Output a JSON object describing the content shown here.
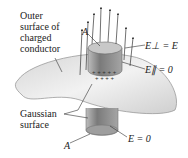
{
  "diagram": {
    "labels": {
      "outer_surface": [
        "Outer",
        "surface of",
        "charged",
        "conductor"
      ],
      "gaussian": [
        "Gaussian",
        "surface"
      ],
      "area_top": "A",
      "area_bottom": "A",
      "e_perp_outside": "E⊥ = E",
      "e_parallel_zero": "E∥ = 0",
      "e_inside": "E = 0"
    },
    "colors": {
      "conductor_fill": "#e6e6e6",
      "conductor_edge": "#9a9a9a",
      "cylinder": "#8c8c8c",
      "arrow": "#333333"
    }
  }
}
